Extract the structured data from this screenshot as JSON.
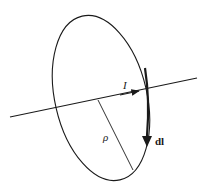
{
  "diagram": {
    "labels": {
      "current": "I",
      "radius": "ρ",
      "line_element": "dl"
    },
    "colors": {
      "stroke": "#1a1a1a",
      "background": "#ffffff"
    }
  }
}
